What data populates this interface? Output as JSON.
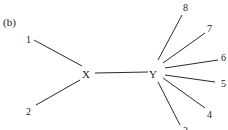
{
  "panel_label": "(b)",
  "nodes": {
    "X": "X",
    "Y": "Y",
    "n1": "1",
    "n2": "2",
    "n3": "3",
    "n4": "4",
    "n5": "5",
    "n6": "6",
    "n7": "7",
    "n8": "8"
  },
  "edges": [
    [
      "1",
      "X"
    ],
    [
      "2",
      "X"
    ],
    [
      "X",
      "Y"
    ],
    [
      "Y",
      "8"
    ],
    [
      "Y",
      "7"
    ],
    [
      "Y",
      "6"
    ],
    [
      "Y",
      "5"
    ],
    [
      "Y",
      "4"
    ],
    [
      "Y",
      "3"
    ]
  ],
  "colors": {
    "line": "#2a2a2a",
    "text": "#1a1a1a",
    "background": "#ffffff"
  }
}
